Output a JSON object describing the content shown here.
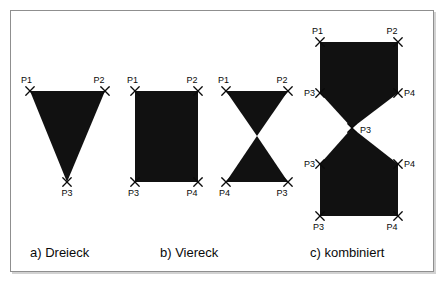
{
  "figure": {
    "background_color": "#ffffff",
    "frame_color": "#8f8f8f",
    "shape_color": "#111111",
    "label_color": "#0a0a0a"
  },
  "captions": [
    {
      "id": "caption-a",
      "text": "a) Dreieck",
      "x": 30,
      "y": 257
    },
    {
      "id": "caption-b",
      "text": "b) Viereck",
      "x": 160,
      "y": 257
    },
    {
      "id": "caption-c",
      "text": "c) kombiniert",
      "x": 310,
      "y": 257
    }
  ],
  "shapes": [
    {
      "id": "triangle",
      "name": "dreieck-triangle",
      "kind": "triangle",
      "polygon": "30,91 105,91 67,182",
      "markers": [
        {
          "label": "P1",
          "x": 30,
          "y": 91,
          "lx": 21,
          "ly": 83,
          "anchor": "start"
        },
        {
          "label": "P2",
          "x": 105,
          "y": 91,
          "lx": 99,
          "ly": 83,
          "anchor": "middle"
        },
        {
          "label": "P3",
          "x": 67,
          "y": 182,
          "lx": 67,
          "ly": 196,
          "anchor": "middle"
        }
      ]
    },
    {
      "id": "quad-rect",
      "name": "viereck-rectangle",
      "kind": "quadrilateral",
      "polygon": "135,91 198,91 198,182 135,182",
      "markers": [
        {
          "label": "P1",
          "x": 135,
          "y": 91,
          "lx": 127,
          "ly": 83,
          "anchor": "start"
        },
        {
          "label": "P2",
          "x": 198,
          "y": 91,
          "lx": 192,
          "ly": 83,
          "anchor": "middle"
        },
        {
          "label": "P3",
          "x": 135,
          "y": 182,
          "lx": 128,
          "ly": 196,
          "anchor": "start"
        },
        {
          "label": "P4",
          "x": 198,
          "y": 182,
          "lx": 192,
          "ly": 196,
          "anchor": "middle"
        }
      ]
    },
    {
      "id": "quad-bowtie",
      "name": "viereck-bowtie",
      "kind": "quadrilateral-crossed",
      "polygon": "226,91 288,91 257,136",
      "polygon2": "226,182 288,182 257,136",
      "markers": [
        {
          "label": "P1",
          "x": 226,
          "y": 91,
          "lx": 218,
          "ly": 83,
          "anchor": "start"
        },
        {
          "label": "P2",
          "x": 288,
          "y": 91,
          "lx": 282,
          "ly": 83,
          "anchor": "middle"
        },
        {
          "label": "P4",
          "x": 226,
          "y": 182,
          "lx": 219,
          "ly": 196,
          "anchor": "start"
        },
        {
          "label": "P3",
          "x": 288,
          "y": 182,
          "lx": 282,
          "ly": 196,
          "anchor": "middle"
        }
      ]
    },
    {
      "id": "combined",
      "name": "kombiniert-shape",
      "kind": "combined",
      "polygon": "320,42 398,42 398,93 352,128 320,93",
      "polygon2": "320,216 398,216 398,164 352,128 320,164",
      "markers": [
        {
          "label": "P1",
          "x": 320,
          "y": 42,
          "lx": 312,
          "ly": 34,
          "anchor": "start"
        },
        {
          "label": "P2",
          "x": 398,
          "y": 42,
          "lx": 392,
          "ly": 34,
          "anchor": "middle"
        },
        {
          "label": "P3",
          "x": 320,
          "y": 93,
          "lx": 315,
          "ly": 96,
          "anchor": "end"
        },
        {
          "label": "P4",
          "x": 398,
          "y": 93,
          "lx": 404,
          "ly": 96,
          "anchor": "start"
        },
        {
          "label": "P3",
          "x": 352,
          "y": 128,
          "lx": 360,
          "ly": 133,
          "anchor": "start"
        },
        {
          "label": "P3",
          "x": 320,
          "y": 164,
          "lx": 315,
          "ly": 167,
          "anchor": "end"
        },
        {
          "label": "P4",
          "x": 398,
          "y": 164,
          "lx": 404,
          "ly": 167,
          "anchor": "start"
        },
        {
          "label": "P3",
          "x": 320,
          "y": 216,
          "lx": 313,
          "ly": 230,
          "anchor": "start"
        },
        {
          "label": "P4",
          "x": 398,
          "y": 216,
          "lx": 392,
          "ly": 230,
          "anchor": "middle"
        }
      ]
    }
  ]
}
